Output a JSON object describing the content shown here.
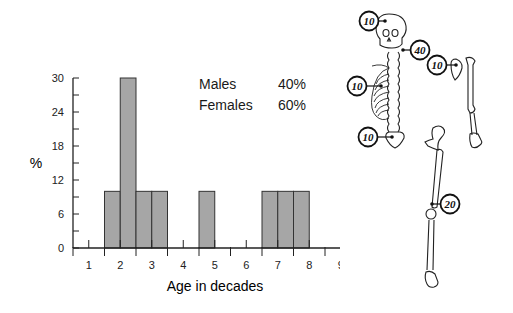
{
  "chart_data": {
    "type": "bar",
    "title": "",
    "xlabel": "Age in decades",
    "ylabel": "%",
    "ylim": [
      0,
      30
    ],
    "yticks": [
      0,
      6,
      12,
      18,
      24,
      30
    ],
    "xticks": [
      "1",
      "2",
      "3",
      "4",
      "5",
      "6",
      "7",
      "8",
      "9"
    ],
    "grid": false,
    "bins": [
      {
        "start": 1.5,
        "end": 2.0,
        "value": 10
      },
      {
        "start": 2.0,
        "end": 2.5,
        "value": 30
      },
      {
        "start": 2.5,
        "end": 3.0,
        "value": 10
      },
      {
        "start": 3.0,
        "end": 3.5,
        "value": 10
      },
      {
        "start": 4.5,
        "end": 5.0,
        "value": 10
      },
      {
        "start": 6.5,
        "end": 7.0,
        "value": 10
      },
      {
        "start": 7.0,
        "end": 7.5,
        "value": 10
      },
      {
        "start": 7.5,
        "end": 8.0,
        "value": 10
      }
    ],
    "bar_color": "#a6a6a6",
    "annotations": [
      {
        "label": "Males",
        "value": "40%"
      },
      {
        "label": "Females",
        "value": "60%"
      }
    ]
  },
  "sex_distribution": {
    "males_label": "Males",
    "males_value": "40%",
    "females_label": "Females",
    "females_value": "60%"
  },
  "skeleton_sites": {
    "skull": "10",
    "cervical_spine": "40",
    "ribs": "10",
    "humerus_shoulder": "10",
    "sacrum": "10",
    "femur_knee": "20"
  }
}
